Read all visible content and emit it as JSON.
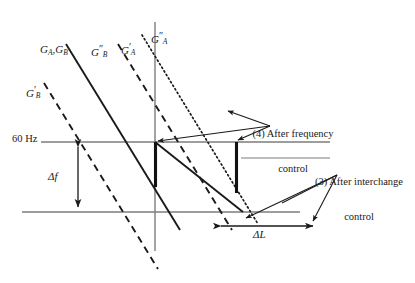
{
  "figure": {
    "type": "engineering-diagram",
    "background_color": "#ffffff",
    "line_color": "#1a1a1a",
    "axis_color": "#808080"
  },
  "curve_labels": {
    "ga_gb": {
      "base1": "G",
      "sub1": "A",
      "sep": ",",
      "base2": "G",
      "sub2": "B",
      "prime": ""
    },
    "gb_prime": {
      "base": "G",
      "prime": "′",
      "sub": "B"
    },
    "gb_double_prime": {
      "base": "G",
      "prime": "″",
      "sub": "B"
    },
    "ga_prime": {
      "base": "G",
      "prime": "′",
      "sub": "A"
    },
    "ga_double_prime": {
      "base": "G",
      "prime": "″",
      "sub": "A"
    }
  },
  "axis": {
    "frequency_label": "60 Hz"
  },
  "measures": {
    "delta_f": "Δf",
    "delta_l": "ΔL"
  },
  "callouts": {
    "frequency_control": "(4) After frequency\ncontrol",
    "frequency_control_line1": "(4) After frequency",
    "frequency_control_line2": "control",
    "interchange_control_line1": "(3) After interchange",
    "interchange_control_line2": "control"
  },
  "colors": {
    "stroke": "#1a1a1a",
    "axis": "#7d7d7d",
    "thick_bar": "#111111"
  }
}
